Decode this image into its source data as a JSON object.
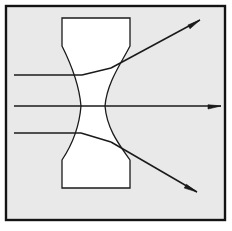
{
  "figure": {
    "kind": "optics-ray-diagram",
    "width": 232,
    "height": 231,
    "canvas_background": "#ffffff",
    "panel_background": "#e9e9e9",
    "lens_fill": "#ffffff",
    "stroke_color": "#1a1a1a",
    "frame": {
      "x": 6,
      "y": 6,
      "width": 219,
      "height": 214,
      "stroke_width": 2.4,
      "stroke_color": "#141414"
    },
    "lens": {
      "label": "biconcave-diverging-lens",
      "top_block": {
        "left": 62,
        "right": 130,
        "top": 18,
        "shoulder": 46
      },
      "bottom_block": {
        "left": 62,
        "right": 130,
        "bottom": 188,
        "shoulder": 160
      },
      "waist": {
        "y": 106,
        "left": 81,
        "right": 105
      },
      "stroke_width": 1.3,
      "outline_path": "M 62 18 L 130 18 L 130 46 C 122 62 107 82 105 106 C 107 131 122 148 130 160 L 130 188 L 62 188 L 62 160 C 70 148 79 131 81 106 C 79 82 70 62 62 46 Z"
    },
    "rays": [
      {
        "name": "upper-incident-ray",
        "incident": {
          "x1": 14,
          "y1": 75,
          "x2": 82,
          "y2": 75
        },
        "internal": {
          "x1": 82,
          "y1": 75,
          "x2": 111,
          "y2": 68
        },
        "emergent": {
          "x1": 111,
          "y1": 68,
          "x2": 200,
          "y2": 20
        },
        "arrowhead": true,
        "arrow_tip": {
          "x": 200,
          "y": 20
        },
        "direction": "diverges-upward"
      },
      {
        "name": "axial-ray",
        "incident": {
          "x1": 14,
          "y1": 106,
          "x2": 81,
          "y2": 106
        },
        "internal": {
          "x1": 81,
          "y1": 106,
          "x2": 105,
          "y2": 106
        },
        "emergent": {
          "x1": 105,
          "y1": 106,
          "x2": 221,
          "y2": 106
        },
        "arrowhead": true,
        "arrow_tip": {
          "x": 221,
          "y": 106
        },
        "direction": "undeviated-through-optical-axis"
      },
      {
        "name": "lower-incident-ray",
        "incident": {
          "x1": 14,
          "y1": 133,
          "x2": 81,
          "y2": 133
        },
        "internal": {
          "x1": 81,
          "y1": 133,
          "x2": 111,
          "y2": 142
        },
        "emergent": {
          "x1": 111,
          "y1": 142,
          "x2": 197,
          "y2": 192
        },
        "arrowhead": true,
        "arrow_tip": {
          "x": 197,
          "y": 192
        },
        "direction": "diverges-downward"
      }
    ],
    "ray_stroke_width": 1.5,
    "arrow_length": 13,
    "arrow_half_width": 3.0
  }
}
